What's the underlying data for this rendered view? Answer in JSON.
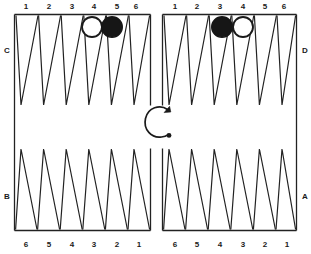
{
  "figure": {
    "kind": "backgammon-board-diagram",
    "colors": {
      "ink": "#1a1a1a",
      "board_line": "#222222",
      "checker_black": "#161616",
      "checker_white": "#ffffff",
      "background": "#ffffff"
    }
  },
  "corner_labels": {
    "top_left": "C",
    "top_right": "D",
    "bottom_left": "B",
    "bottom_right": "A"
  },
  "quadrants": {
    "top_left": {
      "point_labels": [
        "1",
        "2",
        "3",
        "4",
        "5",
        "6"
      ],
      "label_position": "above"
    },
    "top_right": {
      "point_labels": [
        "1",
        "2",
        "3",
        "4",
        "5",
        "6"
      ],
      "label_position": "above"
    },
    "bottom_left": {
      "point_labels": [
        "6",
        "5",
        "4",
        "3",
        "2",
        "1"
      ],
      "label_position": "below"
    },
    "bottom_right": {
      "point_labels": [
        "6",
        "5",
        "4",
        "3",
        "2",
        "1"
      ],
      "label_position": "below"
    }
  },
  "checkers": [
    {
      "id": "checker-1",
      "quadrant": "top_left",
      "point": "4",
      "color": "white",
      "cx": 92,
      "cy": 27,
      "r": 10
    },
    {
      "id": "checker-2",
      "quadrant": "top_left",
      "point": "5",
      "color": "black",
      "cx": 112,
      "cy": 27,
      "r": 10
    },
    {
      "id": "checker-3",
      "quadrant": "top_right",
      "point": "3",
      "color": "black",
      "cx": 222,
      "cy": 27,
      "r": 10
    },
    {
      "id": "checker-4",
      "quadrant": "top_right",
      "point": "4",
      "color": "white",
      "cx": 243,
      "cy": 27,
      "r": 10
    }
  ],
  "center_arrow": {
    "name": "counterclockwise-direction-arrow",
    "shape": "open-c-arc",
    "arrowhead_end": "top-right",
    "dot_end": "bottom-right"
  },
  "numbers_top_left": {
    "n1": "1",
    "n2": "2",
    "n3": "3",
    "n4": "4",
    "n5": "5",
    "n6": "6"
  },
  "numbers_top_right": {
    "n1": "1",
    "n2": "2",
    "n3": "3",
    "n4": "4",
    "n5": "5",
    "n6": "6"
  },
  "numbers_bottom_left": {
    "n1": "6",
    "n2": "5",
    "n3": "4",
    "n4": "3",
    "n5": "2",
    "n6": "1"
  },
  "numbers_bottom_right": {
    "n1": "6",
    "n2": "5",
    "n3": "4",
    "n4": "3",
    "n5": "2",
    "n6": "1"
  }
}
